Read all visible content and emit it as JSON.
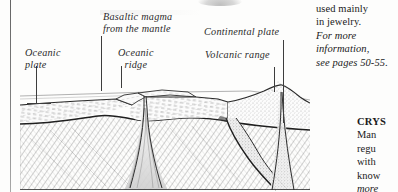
{
  "page": {
    "background_color": "#fdfdfc",
    "ink_color": "#2b2b2b"
  },
  "diagram": {
    "labels": [
      {
        "id": "basaltic-magma",
        "line1": "Basaltic  magma",
        "line2": "from the mantle"
      },
      {
        "id": "continental-plate",
        "line1": "Continental  plate",
        "line2": ""
      },
      {
        "id": "oceanic-plate",
        "line1": "Oceanic",
        "line2": "plate"
      },
      {
        "id": "oceanic-ridge",
        "line1": "Oceanic",
        "line2": "ridge"
      },
      {
        "id": "volcanic-range",
        "line1": "Volcanic  range",
        "line2": ""
      }
    ]
  },
  "column_top_right": {
    "lines": [
      {
        "text": "used mainly",
        "style": "roman"
      },
      {
        "text": "in jewelry.",
        "style": "roman"
      },
      {
        "text": "For more",
        "style": "italic"
      },
      {
        "text": "information,",
        "style": "italic"
      },
      {
        "text": "see pages 50-55.",
        "style": "italic"
      }
    ]
  },
  "column_bottom_right": {
    "lines": [
      {
        "text": "CRYS",
        "style": "bold"
      },
      {
        "text": "Man",
        "style": "roman"
      },
      {
        "text": "regu",
        "style": "roman"
      },
      {
        "text": "with",
        "style": "roman"
      },
      {
        "text": "know",
        "style": "roman"
      },
      {
        "text": "more",
        "style": "italic"
      },
      {
        "text": "page",
        "style": "italic"
      }
    ]
  }
}
